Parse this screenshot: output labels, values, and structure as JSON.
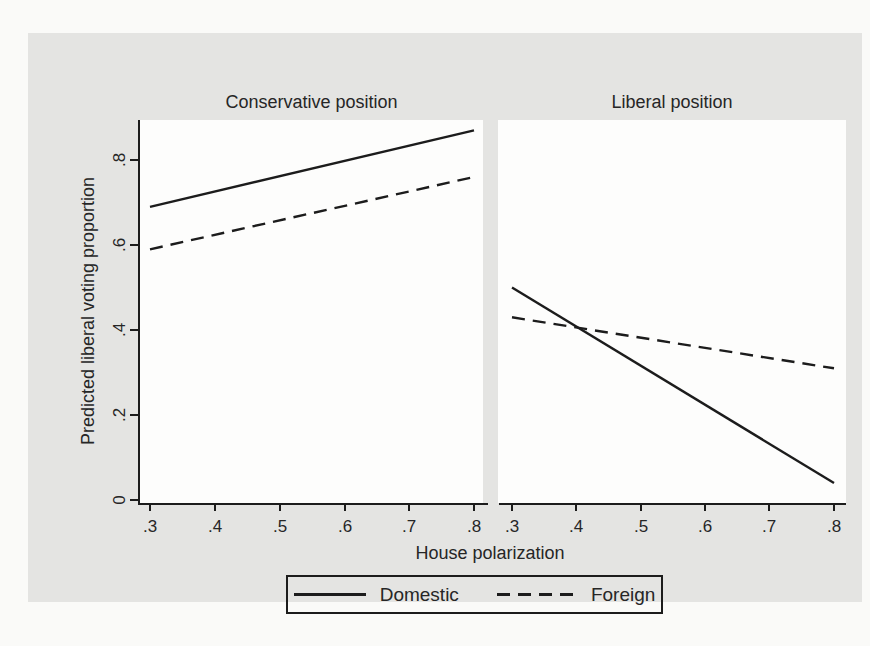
{
  "colors": {
    "page_bg": "#fafaf8",
    "figure_bg": "#e4e4e2",
    "plot_bg": "#fdfdfc",
    "line": "#1c1c1c",
    "text": "#262626"
  },
  "chart_data": {
    "type": "line",
    "layout": "two-panel shared axes",
    "xlabel": "House polarization",
    "ylabel": "Predicted liberal voting proportion",
    "x_plot_range": [
      0.3,
      0.8
    ],
    "xlim": [
      0.28,
      0.82
    ],
    "ylim": [
      0,
      0.9
    ],
    "x_ticks": [
      ".3",
      ".4",
      ".5",
      ".6",
      ".7",
      ".8"
    ],
    "x_tick_values": [
      0.3,
      0.4,
      0.5,
      0.6,
      0.7,
      0.8
    ],
    "y_ticks": [
      "0",
      ".2",
      ".4",
      ".6",
      ".8"
    ],
    "y_tick_values": [
      0,
      0.2,
      0.4,
      0.6,
      0.8
    ],
    "grid": false,
    "panels": [
      {
        "title": "Conservative position",
        "series": [
          {
            "name": "Domestic",
            "style": "solid",
            "points": [
              [
                0.3,
                0.69
              ],
              [
                0.8,
                0.87
              ]
            ]
          },
          {
            "name": "Foreign",
            "style": "dashed",
            "points": [
              [
                0.3,
                0.59
              ],
              [
                0.8,
                0.76
              ]
            ]
          }
        ]
      },
      {
        "title": "Liberal position",
        "series": [
          {
            "name": "Domestic",
            "style": "solid",
            "points": [
              [
                0.3,
                0.5
              ],
              [
                0.8,
                0.04
              ]
            ]
          },
          {
            "name": "Foreign",
            "style": "dashed",
            "points": [
              [
                0.3,
                0.43
              ],
              [
                0.8,
                0.31
              ]
            ]
          }
        ]
      }
    ],
    "legend": {
      "position": "bottom",
      "entries": [
        {
          "label": "Domestic",
          "style": "solid"
        },
        {
          "label": "Foreign",
          "style": "dashed"
        }
      ]
    }
  }
}
